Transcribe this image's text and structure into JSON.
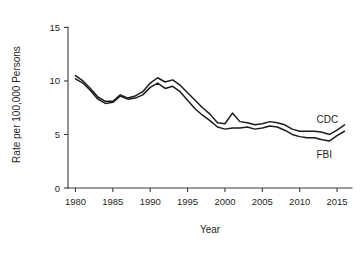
{
  "chart_data": {
    "type": "line",
    "title": "",
    "xlabel": "Year",
    "ylabel": "Rate per 100,000 Persons",
    "xlim": [
      1979,
      2017
    ],
    "ylim": [
      0,
      15.6
    ],
    "xticks": [
      1980,
      1985,
      1990,
      1995,
      2000,
      2005,
      2010,
      2015
    ],
    "yticks": [
      0,
      5,
      10,
      15
    ],
    "grid": false,
    "legend_position": "inline-right",
    "x": [
      1980,
      1981,
      1982,
      1983,
      1984,
      1985,
      1986,
      1987,
      1988,
      1989,
      1990,
      1991,
      1992,
      1993,
      1994,
      1995,
      1996,
      1997,
      1998,
      1999,
      2000,
      2001,
      2002,
      2003,
      2004,
      2005,
      2006,
      2007,
      2008,
      2009,
      2010,
      2011,
      2012,
      2013,
      2014,
      2015,
      2016
    ],
    "series": [
      {
        "name": "CDC",
        "label": "CDC",
        "color": "#1c1c1c",
        "values": [
          10.5,
          10.0,
          9.3,
          8.5,
          8.1,
          8.1,
          8.7,
          8.4,
          8.6,
          9.0,
          9.8,
          10.3,
          9.9,
          10.1,
          9.6,
          8.9,
          8.2,
          7.5,
          6.9,
          6.1,
          6.0,
          7.0,
          6.2,
          6.1,
          5.9,
          6.0,
          6.2,
          6.1,
          5.9,
          5.5,
          5.3,
          5.3,
          5.3,
          5.2,
          5.0,
          5.4,
          5.9
        ]
      },
      {
        "name": "FBI",
        "label": "FBI",
        "color": "#1c1c1c",
        "values": [
          10.2,
          9.8,
          9.1,
          8.3,
          7.9,
          8.0,
          8.6,
          8.3,
          8.4,
          8.7,
          9.4,
          9.8,
          9.3,
          9.5,
          9.0,
          8.2,
          7.4,
          6.8,
          6.3,
          5.7,
          5.5,
          5.6,
          5.6,
          5.7,
          5.5,
          5.6,
          5.8,
          5.7,
          5.4,
          5.0,
          4.8,
          4.7,
          4.7,
          4.5,
          4.4,
          4.9,
          5.3
        ]
      }
    ]
  },
  "axes": {
    "y_title": "Rate per 100,000 Persons",
    "x_title": "Year",
    "y_tick_labels": [
      "0",
      "5",
      "10",
      "15"
    ],
    "x_tick_labels": [
      "1980",
      "1985",
      "1990",
      "1995",
      "2000",
      "2005",
      "2010",
      "2015"
    ]
  },
  "annotations": {
    "cdc_label": "CDC",
    "fbi_label": "FBI"
  }
}
